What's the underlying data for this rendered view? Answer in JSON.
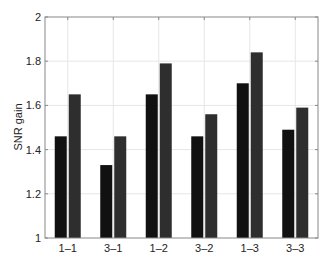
{
  "chart_data": {
    "type": "bar",
    "title": "",
    "xlabel": "",
    "ylabel": "SNR gain",
    "ylim": [
      1,
      2
    ],
    "yticks": [
      1,
      1.2,
      1.4,
      1.6,
      1.8,
      2
    ],
    "ytick_labels": [
      "1",
      "1.2",
      "1.4",
      "1.6",
      "1.8",
      "2"
    ],
    "grid": true,
    "legend": null,
    "categories": [
      "1–1",
      "3–1",
      "1–2",
      "3–2",
      "1–3",
      "3–3"
    ],
    "series": [
      {
        "name": "series-1",
        "color": "#111111",
        "values": [
          1.46,
          1.33,
          1.65,
          1.46,
          1.7,
          1.49
        ]
      },
      {
        "name": "series-2",
        "color": "#2e2e2e",
        "values": [
          1.65,
          1.46,
          1.79,
          1.56,
          1.84,
          1.59
        ]
      }
    ]
  },
  "colors": {
    "axis": "#555555",
    "grid": "#e6e6e6",
    "background": "#ffffff"
  }
}
